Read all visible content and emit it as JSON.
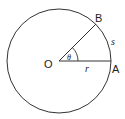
{
  "diagram": {
    "type": "circle-arc-radian",
    "labels": {
      "center": "O",
      "point_a": "A",
      "point_b": "B",
      "arc": "s",
      "radius": "r",
      "angle": "θ"
    },
    "colors": {
      "stroke": "#333333",
      "background": "#ffffff"
    }
  }
}
